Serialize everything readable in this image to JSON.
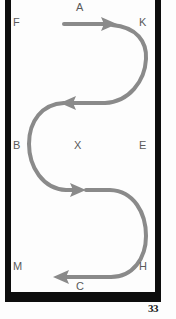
{
  "document": {
    "type": "scanned-book-page",
    "page_number": "33",
    "background_color": "#fdfdfd",
    "frame_color": "#0d0d0d"
  },
  "frame": {
    "label": "diagram-border",
    "left_x": 5,
    "right_x": 161,
    "bottom_y": 302,
    "thickness": 6
  },
  "diagram": {
    "title": "",
    "stroke_color": "#8a8a8a",
    "stroke_width": 4,
    "labels": [
      {
        "id": "A",
        "text": "A",
        "x": 76,
        "y": 2,
        "role": "top-center"
      },
      {
        "id": "F",
        "text": "F",
        "x": 13,
        "y": 17,
        "role": "top-left"
      },
      {
        "id": "K",
        "text": "K",
        "x": 139,
        "y": 17,
        "role": "top-right"
      },
      {
        "id": "B",
        "text": "B",
        "x": 13,
        "y": 140,
        "role": "middle-left"
      },
      {
        "id": "X",
        "text": "X",
        "x": 74,
        "y": 140,
        "role": "center"
      },
      {
        "id": "E",
        "text": "E",
        "x": 139,
        "y": 140,
        "role": "middle-right"
      },
      {
        "id": "M",
        "text": "M",
        "x": 13,
        "y": 261,
        "role": "bottom-left"
      },
      {
        "id": "H",
        "text": "H",
        "x": 139,
        "y": 261,
        "role": "bottom-right"
      },
      {
        "id": "C",
        "text": "C",
        "x": 76,
        "y": 281,
        "role": "bottom-center"
      }
    ],
    "arrows": [
      {
        "id": "arrow-1",
        "direction": "right",
        "tip_x": 116,
        "tip_y": 24,
        "near_label": "A"
      },
      {
        "id": "arrow-2",
        "direction": "left",
        "tip_x": 62,
        "tip_y": 103,
        "near_label": "X"
      },
      {
        "id": "arrow-3",
        "direction": "right",
        "tip_x": 84,
        "tip_y": 190,
        "near_label": "X"
      },
      {
        "id": "arrow-4",
        "direction": "left",
        "tip_x": 55,
        "tip_y": 277,
        "near_label": "C"
      }
    ],
    "path_d": "M 64 24 L 112 24 C 138 24 146 40 146 58 C 146 80 132 103 106 103 L 66 103 C 44 103 30 120 30 144 C 30 168 44 190 68 190 L 110 190 C 134 190 146 212 146 236 C 146 258 134 277 112 277 L 59 277"
  },
  "page_number_position": {
    "x": 148,
    "y": 303
  }
}
